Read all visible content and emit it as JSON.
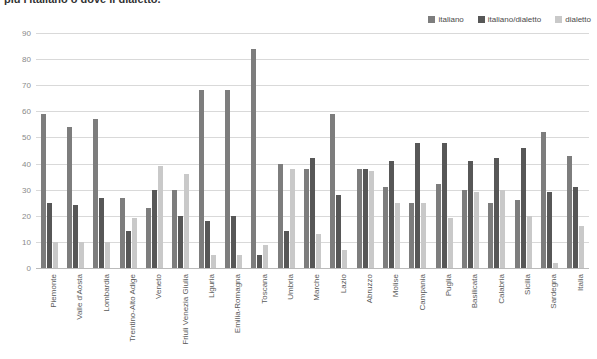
{
  "title": "più l'italiano o dove il dialetto.",
  "legend": {
    "position": "top-right",
    "entries": [
      {
        "label": "italiano",
        "color": "#7d7d7d"
      },
      {
        "label": "italiano/dialetto",
        "color": "#575757"
      },
      {
        "label": "dialetto",
        "color": "#c9c9c9"
      }
    ]
  },
  "chart_data": {
    "type": "bar",
    "title": "più l'italiano o dove il dialetto.",
    "xlabel": "",
    "ylabel": "",
    "ylim": [
      0,
      90
    ],
    "ytick_step": 10,
    "yticks": [
      90,
      80,
      70,
      60,
      50,
      40,
      30,
      20,
      10,
      0
    ],
    "grid": true,
    "legend_position": "top-right",
    "categories": [
      "Piemonte",
      "Valle d'Aosta",
      "Lombardia",
      "Trentino-Alto Adige",
      "Veneto",
      "Friuli Venezia Giulia",
      "Liguria",
      "Emilia-Romagna",
      "Toscana",
      "Umbria",
      "Marche",
      "Lazio",
      "Abruzzo",
      "Molise",
      "Campania",
      "Puglia",
      "Basilicata",
      "Calabria",
      "Sicilia",
      "Sardegna",
      "Italia"
    ],
    "series": [
      {
        "name": "italiano",
        "color": "#7d7d7d",
        "values": [
          59,
          54,
          57,
          27,
          23,
          30,
          68,
          68,
          84,
          40,
          38,
          59,
          38,
          31,
          25,
          32,
          30,
          25,
          26,
          52,
          43
        ]
      },
      {
        "name": "italiano/dialetto",
        "color": "#575757",
        "values": [
          25,
          24,
          27,
          14,
          30,
          20,
          18,
          20,
          5,
          14,
          42,
          28,
          38,
          41,
          48,
          48,
          41,
          42,
          46,
          29,
          31
        ]
      },
      {
        "name": "dialetto",
        "color": "#c9c9c9",
        "values": [
          10,
          10,
          10,
          19,
          39,
          36,
          5,
          5,
          9,
          38,
          13,
          7,
          37,
          25,
          25,
          19,
          29,
          30,
          20,
          2,
          16
        ]
      }
    ]
  }
}
